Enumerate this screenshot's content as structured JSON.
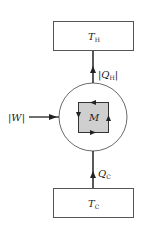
{
  "diagram": {
    "hot_reservoir": {
      "label": "T",
      "subscript": "H"
    },
    "cold_reservoir": {
      "label": "T",
      "subscript": "C"
    },
    "machine": {
      "label": "M"
    },
    "heat_out": {
      "label": "|Q",
      "subscript": "H",
      "suffix": "|"
    },
    "heat_in": {
      "label": "Q",
      "subscript": "C"
    },
    "work_in": {
      "label": "|W|"
    },
    "colors": {
      "line": "#222222",
      "box_fill": "#ffffff",
      "square_fill": "#cfcfcf",
      "box_stroke": "#555555"
    }
  }
}
